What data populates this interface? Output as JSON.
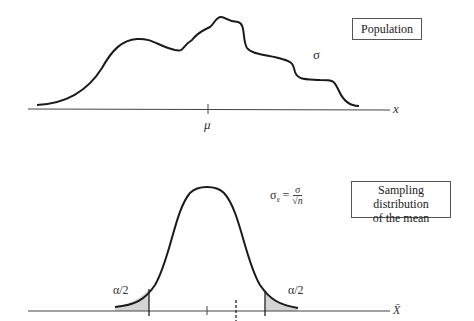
{
  "population_panel": {
    "label_box": "Population",
    "sigma_label": "σ",
    "mean_label": "μ",
    "axis_label": "x"
  },
  "sampling_panel": {
    "label_box_line1": "Sampling distribution",
    "label_box_line2": "of the mean",
    "formula_lhs": "σ",
    "formula_sub": "x̄",
    "formula_eq": "=",
    "formula_num": "σ",
    "formula_den": "√n",
    "left_tail_label": "α/2",
    "right_tail_label": "α/2",
    "axis_label": "X̄"
  },
  "colors": {
    "curve": "#1a1a1a",
    "axis": "#444444",
    "tail_fill": "#d4d4d4",
    "box_border": "#555555"
  }
}
